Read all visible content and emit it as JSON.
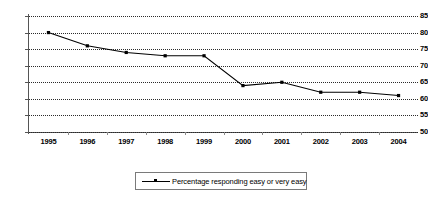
{
  "chart_data": {
    "type": "line",
    "title": "",
    "xlabel": "",
    "ylabel": "",
    "categories": [
      "1995",
      "1996",
      "1997",
      "1998",
      "1999",
      "2000",
      "2001",
      "2002",
      "2003",
      "2004"
    ],
    "values": [
      80,
      76,
      74,
      73,
      73,
      64,
      65,
      62,
      62,
      61
    ],
    "series": [
      {
        "name": "Percentage responding easy or very easy",
        "values": [
          80,
          76,
          74,
          73,
          73,
          64,
          65,
          62,
          62,
          61
        ]
      }
    ],
    "ylim": [
      50,
      85
    ],
    "yticks": [
      50,
      55,
      60,
      65,
      70,
      75,
      80,
      85
    ],
    "ytick_labels": [
      "50",
      "55",
      "60",
      "65",
      "70",
      "75",
      "80",
      "85"
    ],
    "xtick_labels": [
      "1995",
      "1996",
      "1997",
      "1998",
      "1999",
      "2000",
      "2001",
      "2002",
      "2003",
      "2004"
    ],
    "grid": "horizontal-dotted",
    "legend_position": "bottom-center",
    "line_color": "#000000",
    "marker": "square",
    "background_color": "#ffffff"
  },
  "legend": {
    "entries": [
      {
        "label": "Percentage responding easy or very easy"
      }
    ]
  }
}
